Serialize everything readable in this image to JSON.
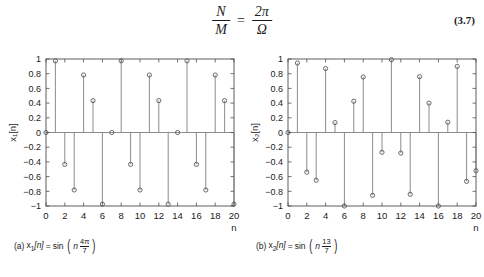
{
  "equation": {
    "numerator_left": "N",
    "denominator_left": "M",
    "equals": "=",
    "numerator_right": "2π",
    "denominator_right": "Ω",
    "number": "(3.7)"
  },
  "panels": [
    {
      "id": "a",
      "caption": {
        "index": "(a)",
        "name": "x",
        "name_sub": "1",
        "bracket": "[n]",
        "equals": "=",
        "func": "sin",
        "arg_var": "n",
        "arg_num": "4π",
        "arg_den": "7"
      },
      "chart_data": {
        "type": "scatter",
        "stem": true,
        "title": "",
        "xlabel": "n",
        "ylabel": "x₁[n]",
        "xlim": [
          0,
          20
        ],
        "ylim": [
          -1,
          1
        ],
        "xticks": [
          0,
          2,
          4,
          6,
          8,
          10,
          12,
          14,
          16,
          18,
          20
        ],
        "xticklabels": [
          "0",
          "2",
          "4",
          "6",
          "8",
          "10",
          "12",
          "14",
          "16",
          "18",
          "20"
        ],
        "yticks": [
          1,
          0.8,
          0.6,
          0.4,
          0.2,
          0,
          -0.2,
          -0.4,
          -0.6,
          -0.8,
          -1
        ],
        "yticklabels": [
          "1",
          "0.8",
          "0.6",
          "0.4",
          "0.2",
          "0",
          "−0.2",
          "−0.4",
          "−0.6",
          "−0.8",
          "−1"
        ],
        "grid": false,
        "legend": false,
        "x": [
          0,
          1,
          2,
          3,
          4,
          5,
          6,
          7,
          8,
          9,
          10,
          11,
          12,
          13,
          14,
          15,
          16,
          17,
          18,
          19,
          20
        ],
        "values": [
          0.0,
          0.975,
          -0.434,
          -0.782,
          0.782,
          0.434,
          -0.975,
          0.0,
          0.975,
          -0.434,
          -0.782,
          0.782,
          0.434,
          -0.975,
          0.0,
          0.975,
          -0.434,
          -0.782,
          0.782,
          0.434,
          -0.975
        ]
      }
    },
    {
      "id": "b",
      "caption": {
        "index": "(b)",
        "name": "x",
        "name_sub": "2",
        "bracket": "[n]",
        "equals": "=",
        "func": "sin",
        "arg_var": "n",
        "arg_num": "13",
        "arg_den": "7"
      },
      "chart_data": {
        "type": "scatter",
        "stem": true,
        "title": "",
        "xlabel": "n",
        "ylabel": "x₂[n]",
        "xlim": [
          0,
          20
        ],
        "ylim": [
          -1,
          1
        ],
        "xticks": [
          0,
          2,
          4,
          6,
          8,
          10,
          12,
          14,
          16,
          18,
          20
        ],
        "xticklabels": [
          "0",
          "2",
          "4",
          "6",
          "8",
          "10",
          "12",
          "14",
          "16",
          "18",
          "20"
        ],
        "yticks": [
          1,
          0.8,
          0.6,
          0.4,
          0.2,
          0,
          -0.2,
          -0.4,
          -0.6,
          -0.8,
          -1
        ],
        "yticklabels": [
          "1",
          "0.8",
          "0.6",
          "0.4",
          "0.2",
          "0",
          "−0.2",
          "−0.4",
          "−0.6",
          "−0.8",
          "−1"
        ],
        "grid": false,
        "legend": false,
        "x": [
          0,
          1,
          2,
          3,
          4,
          5,
          6,
          7,
          8,
          9,
          10,
          11,
          12,
          13,
          14,
          15,
          16,
          17,
          18,
          19,
          20
        ],
        "values": [
          0.0,
          0.945,
          -0.54,
          -0.65,
          0.87,
          0.135,
          -1.0,
          0.425,
          0.755,
          -0.855,
          -0.27,
          0.99,
          -0.28,
          -0.84,
          0.76,
          0.4,
          -1.0,
          0.14,
          0.9,
          -0.665,
          -0.52
        ]
      }
    }
  ],
  "style": {
    "axis_color": "#4d4d4d",
    "stem_color": "#808080",
    "marker_color": "#595959",
    "text_color": "#1a1a1a"
  }
}
